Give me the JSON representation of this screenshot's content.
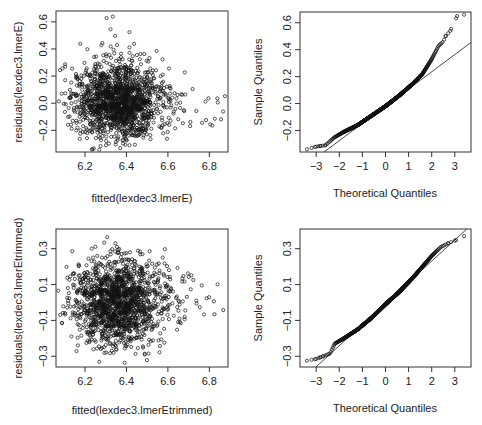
{
  "chart_data": [
    {
      "type": "scatter",
      "panel": "top-left",
      "title": "",
      "xlabel": "fitted(lexdec3.lmerE)",
      "ylabel": "residuals(lexdec3.lmerE)",
      "xlim": [
        6.06,
        6.89
      ],
      "ylim": [
        -0.36,
        0.68
      ],
      "xticks": [
        6.2,
        6.4,
        6.6,
        6.8
      ],
      "xtick_labels": [
        "6.2",
        "6.4",
        "6.6",
        "6.8"
      ],
      "yticks": [
        -0.2,
        0.0,
        0.2,
        0.4,
        0.6
      ],
      "ytick_labels": [
        "-0.2",
        "0.0",
        "0.2",
        "0.4",
        "0.6"
      ],
      "n_points": 1600,
      "x_center": 6.35,
      "x_sd": 0.12,
      "y_center": 0.0,
      "y_sd": 0.13,
      "right_skew": true,
      "grid": false
    },
    {
      "type": "scatter",
      "panel": "top-right",
      "title": "",
      "subtype": "normal-qq",
      "xlabel": "Theoretical Quantiles",
      "ylabel": "Sample Quantiles",
      "xlim": [
        -3.7,
        3.7
      ],
      "ylim": [
        -0.36,
        0.68
      ],
      "xticks": [
        -3,
        -2,
        -1,
        0,
        1,
        2,
        3
      ],
      "xtick_labels": [
        "-3",
        "-2",
        "-1",
        "0",
        "1",
        "2",
        "3"
      ],
      "yticks": [
        -0.2,
        0.0,
        0.2,
        0.4,
        0.6
      ],
      "ytick_labels": [
        "-0.2",
        "0.0",
        "0.2",
        "0.4",
        "0.6"
      ],
      "qq_line": {
        "intercept": -0.02,
        "slope": 0.128
      },
      "curve_points": [
        [
          -3.4,
          -0.34
        ],
        [
          -3.0,
          -0.32
        ],
        [
          -2.6,
          -0.31
        ],
        [
          -2.2,
          -0.25
        ],
        [
          -1.8,
          -0.21
        ],
        [
          -1.2,
          -0.16
        ],
        [
          -0.6,
          -0.09
        ],
        [
          0.0,
          -0.02
        ],
        [
          0.6,
          0.06
        ],
        [
          1.2,
          0.15
        ],
        [
          1.6,
          0.22
        ],
        [
          2.0,
          0.33
        ],
        [
          2.3,
          0.43
        ],
        [
          2.5,
          0.46
        ],
        [
          2.6,
          0.5
        ],
        [
          2.8,
          0.54
        ],
        [
          3.1,
          0.65
        ],
        [
          3.4,
          0.66
        ]
      ],
      "grid": false
    },
    {
      "type": "scatter",
      "panel": "bottom-left",
      "title": "",
      "xlabel": "fitted(lexdec3.lmerEtrimmed)",
      "ylabel": "residuals(lexdec3.lmerEtrimmed)",
      "xlim": [
        6.06,
        6.89
      ],
      "ylim": [
        -0.36,
        0.41
      ],
      "xticks": [
        6.2,
        6.4,
        6.6,
        6.8
      ],
      "xtick_labels": [
        "6.2",
        "6.4",
        "6.6",
        "6.8"
      ],
      "yticks": [
        -0.3,
        -0.1,
        0.1,
        0.3
      ],
      "ytick_labels": [
        "-0.3",
        "-0.1",
        "0.1",
        "0.3"
      ],
      "n_points": 1550,
      "x_center": 6.35,
      "x_sd": 0.12,
      "y_center": 0.0,
      "y_sd": 0.12,
      "right_skew": false,
      "grid": false
    },
    {
      "type": "scatter",
      "panel": "bottom-right",
      "title": "",
      "subtype": "normal-qq",
      "xlabel": "Theoretical Quantiles",
      "ylabel": "Sample Quantiles",
      "xlim": [
        -3.7,
        3.7
      ],
      "ylim": [
        -0.36,
        0.41
      ],
      "xticks": [
        -3,
        -2,
        -1,
        0,
        1,
        2,
        3
      ],
      "xtick_labels": [
        "-3",
        "-2",
        "-1",
        "0",
        "1",
        "2",
        "3"
      ],
      "yticks": [
        -0.3,
        -0.1,
        0.1,
        0.3
      ],
      "ytick_labels": [
        "-0.3",
        "-0.1",
        "0.1",
        "0.3"
      ],
      "qq_line": {
        "intercept": -0.005,
        "slope": 0.118
      },
      "curve_points": [
        [
          -3.4,
          -0.325
        ],
        [
          -3.0,
          -0.315
        ],
        [
          -2.7,
          -0.3
        ],
        [
          -2.4,
          -0.285
        ],
        [
          -2.2,
          -0.23
        ],
        [
          -1.8,
          -0.2
        ],
        [
          -1.2,
          -0.15
        ],
        [
          -0.6,
          -0.085
        ],
        [
          0.0,
          -0.01
        ],
        [
          0.6,
          0.06
        ],
        [
          1.2,
          0.14
        ],
        [
          1.6,
          0.2
        ],
        [
          2.0,
          0.26
        ],
        [
          2.4,
          0.31
        ],
        [
          2.7,
          0.33
        ],
        [
          3.0,
          0.345
        ],
        [
          3.4,
          0.37
        ]
      ],
      "grid": false
    }
  ],
  "panels": [
    {
      "xlabel": "fitted(lexdec3.lmerE)",
      "ylabel": "residuals(lexdec3.lmerE)"
    },
    {
      "xlabel": "Theoretical Quantiles",
      "ylabel": "Sample Quantiles"
    },
    {
      "xlabel": "fitted(lexdec3.lmerEtrimmed)",
      "ylabel": "residuals(lexdec3.lmerEtrimmed)"
    },
    {
      "xlabel": "Theoretical Quantiles",
      "ylabel": "Sample Quantiles"
    }
  ]
}
